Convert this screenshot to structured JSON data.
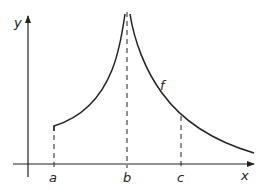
{
  "diagram": {
    "type": "function-graph-with-vertical-asymptote",
    "axes": {
      "x_label": "x",
      "y_label": "y"
    },
    "function_label": "f",
    "points": [
      {
        "label": "a",
        "x": 53
      },
      {
        "label": "b",
        "x": 127
      },
      {
        "label": "c",
        "x": 181
      }
    ],
    "colors": {
      "stroke": "#222222",
      "background": "#ffffff"
    }
  }
}
